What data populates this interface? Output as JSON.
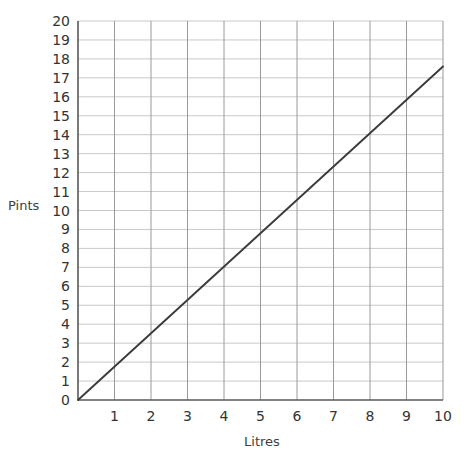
{
  "chart_data": {
    "type": "line",
    "title": "",
    "subtitle": "",
    "xlabel": "Litres",
    "ylabel": "Pints",
    "xlim": [
      0,
      10
    ],
    "ylim": [
      0,
      20
    ],
    "xticks": [
      0,
      1,
      2,
      3,
      4,
      5,
      6,
      7,
      8,
      9,
      10
    ],
    "xtick_labels": [
      "",
      "1",
      "2",
      "3",
      "4",
      "5",
      "6",
      "7",
      "8",
      "9",
      "10"
    ],
    "yticks": [
      0,
      1,
      2,
      3,
      4,
      5,
      6,
      7,
      8,
      9,
      10,
      11,
      12,
      13,
      14,
      15,
      16,
      17,
      18,
      19,
      20
    ],
    "ytick_labels": [
      "0",
      "1",
      "2",
      "3",
      "4",
      "5",
      "6",
      "7",
      "8",
      "9",
      "10",
      "11",
      "12",
      "13",
      "14",
      "15",
      "16",
      "17",
      "18",
      "19",
      "20"
    ],
    "grid": true,
    "legend": null,
    "legend_position": "none",
    "annotations": [],
    "series": [
      {
        "name": "Litres to Pints conversion",
        "x": [
          0,
          10
        ],
        "values": [
          0,
          17.6
        ],
        "color": "#3b3b3b",
        "style": "solid"
      }
    ],
    "reference_points": [
      {
        "x": 0,
        "y": 0
      },
      {
        "x": 1,
        "y": 1.76
      },
      {
        "x": 2,
        "y": 3.52
      },
      {
        "x": 3,
        "y": 5.28
      },
      {
        "x": 4,
        "y": 7.04
      },
      {
        "x": 5,
        "y": 8.8
      },
      {
        "x": 6,
        "y": 10.56
      },
      {
        "x": 7,
        "y": 12.32
      },
      {
        "x": 8,
        "y": 14.08
      },
      {
        "x": 9,
        "y": 15.84
      },
      {
        "x": 10,
        "y": 17.6
      }
    ]
  },
  "colors": {
    "background": "#ffffff",
    "line": "#3b3b3b",
    "grid_horizontal": "#c9c9c9",
    "grid_vertical": "#9a9a9a",
    "axis": "#595959",
    "text": "#333333"
  }
}
